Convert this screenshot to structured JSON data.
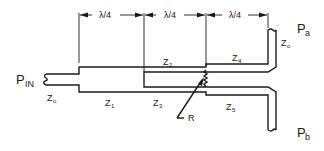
{
  "diagram": {
    "type": "stripline-power-divider",
    "dimension_label": "λ/4",
    "dimensions": [
      {
        "label": "λ/4"
      },
      {
        "label": "λ/4"
      },
      {
        "label": "λ/4"
      }
    ],
    "ports": {
      "input": {
        "main": "P",
        "sub": "IN"
      },
      "output_a": {
        "main": "P",
        "sub": "a"
      },
      "output_b": {
        "main": "P",
        "sub": "b"
      }
    },
    "impedances": {
      "z0_input": {
        "main": "Z",
        "sub": "o"
      },
      "z0_output": {
        "main": "Z",
        "sub": "o"
      },
      "z1": {
        "main": "Z",
        "sub": "1"
      },
      "z2": {
        "main": "Z",
        "sub": "2"
      },
      "z3": {
        "main": "Z",
        "sub": "3"
      },
      "z4": {
        "main": "Z",
        "sub": "4"
      },
      "z5": {
        "main": "Z",
        "sub": "5"
      }
    },
    "resistor": {
      "label": "R"
    }
  }
}
